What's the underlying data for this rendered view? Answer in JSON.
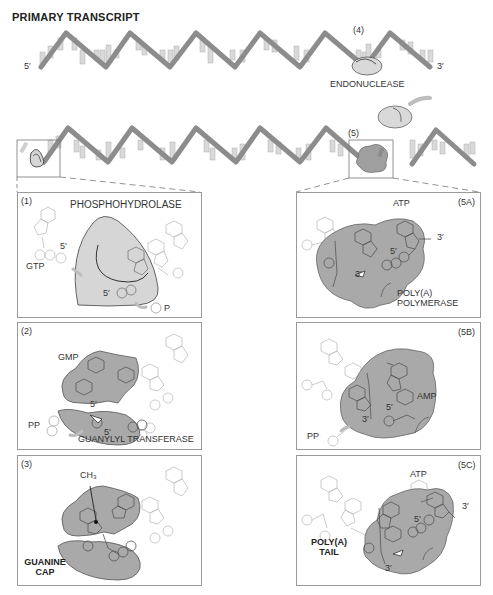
{
  "title": "PRIMARY TRANSCRIPT",
  "top_strand": {
    "five_prime": "5′",
    "three_prime": "3′",
    "step_label": "(4)",
    "enzyme": "ENDONUCLEASE"
  },
  "cleaved_strand": {
    "step_label": "(5)"
  },
  "panels": {
    "p1": {
      "step": "(1)",
      "enzyme": "PHOSPHOHYDROLASE",
      "substrate": "GTP",
      "five_prime_a": "5′",
      "five_prime_b": "5′",
      "product": "P"
    },
    "p2": {
      "step": "(2)",
      "substrate": "GMP",
      "five_prime_a": "5′",
      "five_prime_b": "5′",
      "product": "PP",
      "enzyme": "GUANYLYL TRANSFERASE"
    },
    "p3": {
      "step": "(3)",
      "methyl": "CH₃",
      "cap_line1": "GUANINE",
      "cap_line2": "CAP"
    },
    "p5a": {
      "step": "(5A)",
      "substrate": "ATP",
      "three_prime_a": "3′",
      "five_prime": "5′",
      "three_prime_b": "3′",
      "enzyme_line1": "POLY(A)",
      "enzyme_line2": "POLYMERASE"
    },
    "p5b": {
      "step": "(5B)",
      "nucleotide": "AMP",
      "five_prime": "5′",
      "three_prime": "3′",
      "product": "PP"
    },
    "p5c": {
      "step": "(5C)",
      "substrate": "ATP",
      "three_prime_a": "3′",
      "five_prime": "5′",
      "three_prime_b": "3′",
      "tail_line1": "POLY(A)",
      "tail_line2": "TAIL"
    }
  },
  "colors": {
    "strand": "#8c8c8c",
    "bases": "#d4d4d4",
    "enzyme_fill": "#a9a9a9",
    "enzyme_light": "#d9d9d9",
    "outline": "#555555",
    "panel_border": "#9a9a9a"
  }
}
